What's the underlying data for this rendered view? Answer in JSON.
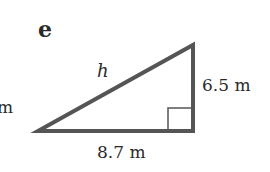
{
  "figure": {
    "part_label": "e",
    "hypotenuse_label": "h",
    "vertical_side_label": "6.5 m",
    "horizontal_side_label": "8.7 m",
    "cut_off_label": "m"
  },
  "colors": {
    "stroke": "#555555",
    "text": "#2a2a2a",
    "background": "#ffffff"
  }
}
